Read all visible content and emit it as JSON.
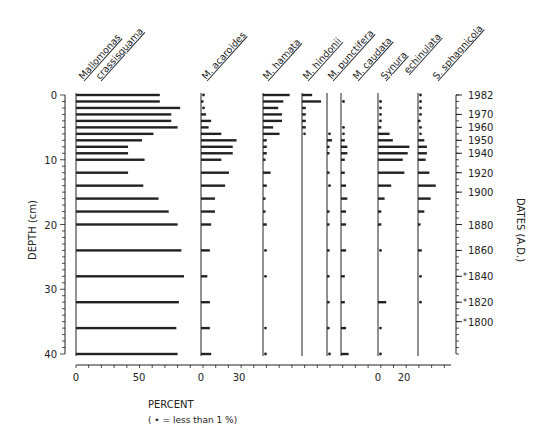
{
  "chart_data": {
    "type": "bar",
    "orientation": "horizontal",
    "subtype": "stratigraphic-diagram",
    "ylabel": "DEPTH (cm)",
    "ylabel_right": "DATES (A.D.)",
    "xlabel": "PERCENT",
    "xlabel_note": "( • = less than 1 %)",
    "depth_range": [
      0,
      40
    ],
    "depth_ticks": [
      "0",
      "10",
      "20",
      "30",
      "40"
    ],
    "date_ticks": [
      {
        "label": "1982",
        "depth": 0
      },
      {
        "label": "1970",
        "depth": 3
      },
      {
        "label": "1960",
        "depth": 5
      },
      {
        "label": "1950",
        "depth": 7
      },
      {
        "label": "1940",
        "depth": 9
      },
      {
        "label": "1920",
        "depth": 12
      },
      {
        "label": "1900",
        "depth": 15
      },
      {
        "label": "1880",
        "depth": 20
      },
      {
        "label": "1860",
        "depth": 24
      },
      {
        "label": "1840",
        "depth": 28
      },
      {
        "label": "1820",
        "depth": 32
      },
      {
        "label": "1800",
        "depth": 35
      }
    ],
    "estimated_dates_marked": [
      "1840",
      "1820",
      "1800"
    ],
    "depths": [
      0,
      1,
      2,
      3,
      4,
      5,
      6,
      7,
      8,
      9,
      10,
      12,
      14,
      16,
      18,
      20,
      24,
      28,
      32,
      36,
      40
    ],
    "trace_value": "<1",
    "series": [
      {
        "name": "Mallomonas crassisquama",
        "axis_ticks": [
          "0",
          "50"
        ],
        "values": [
          66,
          66,
          82,
          75,
          75,
          80,
          61,
          52,
          41,
          41,
          54,
          41,
          53,
          65,
          73,
          80,
          83,
          85,
          81,
          79,
          80
        ]
      },
      {
        "name": "M. acaroides",
        "axis_ticks": [
          "0",
          "30"
        ],
        "values": [
          "<1",
          2,
          "<1",
          4,
          8,
          6,
          16,
          28,
          25,
          25,
          16,
          22,
          19,
          11,
          11,
          8,
          7,
          5,
          7,
          7,
          8
        ]
      },
      {
        "name": "M. hamata",
        "axis_ticks": [],
        "values": [
          21,
          16,
          12,
          15,
          15,
          8,
          13,
          3,
          3,
          3,
          2,
          6,
          3,
          2,
          2,
          3,
          "<1",
          "<1",
          0,
          "<1",
          "<1"
        ]
      },
      {
        "name": "M. hindonii",
        "axis_ticks": [],
        "values": [
          8,
          15,
          3,
          3,
          3,
          3,
          "<1",
          0,
          0,
          0,
          0,
          0,
          0,
          0,
          0,
          0,
          0,
          0,
          0,
          0,
          0
        ]
      },
      {
        "name": "M. punctifera",
        "axis_ticks": [],
        "values": [
          0,
          0,
          0,
          0,
          0,
          0,
          "<1",
          4,
          2,
          2,
          0,
          2,
          "<1",
          0,
          2,
          2,
          2,
          2,
          2,
          2,
          "<1"
        ]
      },
      {
        "name": "M. caudata",
        "axis_ticks": [],
        "values": [
          0,
          "<1",
          0,
          0,
          0,
          "<1",
          "<1",
          3,
          5,
          5,
          3,
          3,
          4,
          5,
          4,
          4,
          4,
          3,
          3,
          4,
          6
        ]
      },
      {
        "name": "Synura echinulata",
        "axis_ticks": [
          "0",
          "20"
        ],
        "values": [
          0,
          "<1",
          "<1",
          "<1",
          "<1",
          2,
          7,
          9,
          19,
          18,
          15,
          16,
          8,
          4,
          2,
          2,
          "<1",
          0,
          5,
          "<1",
          "<1"
        ]
      },
      {
        "name": "S. sphagnicola",
        "axis_ticks": [],
        "values": [
          "<1",
          "<1",
          "<1",
          "<1",
          2,
          "<1",
          "<1",
          5,
          7,
          7,
          6,
          9,
          14,
          10,
          5,
          2,
          3,
          "<1",
          "<1",
          0,
          0
        ]
      }
    ]
  },
  "labels": {
    "title_col1_a": "Mallomonas",
    "title_col1_b": "crassisquama",
    "title_col2": "M. acaroides",
    "title_col3": "M. hamata",
    "title_col4": "M. hindonii",
    "title_col5": "M. punctifera",
    "title_col6": "M. caudata",
    "title_col7_a": "Synura",
    "title_col7_b": "echinulata",
    "title_col8": "S. sphagnicola"
  }
}
